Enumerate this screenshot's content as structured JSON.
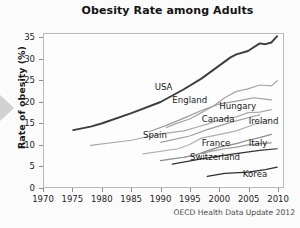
{
  "figure": {
    "title": "Obesity Rate among Adults",
    "source_note": "OECD Health Data Update 2012",
    "nav_arrow_icon": "triangle-right-icon"
  },
  "chart_data": {
    "type": "line",
    "title": "Obesity Rate among Adults",
    "xlabel": "",
    "ylabel": "Rate of obesity (%)",
    "xlim": [
      1970,
      2011
    ],
    "ylim": [
      0,
      36
    ],
    "xticks": [
      1970,
      1975,
      1980,
      1985,
      1990,
      1995,
      2000,
      2005,
      2010
    ],
    "yticks": [
      0,
      5,
      10,
      15,
      20,
      25,
      30,
      35
    ],
    "grid": false,
    "legend_position": "inline-labels",
    "annotation": "OECD Health Data Update 2012",
    "series": [
      {
        "name": "USA",
        "color": "#3d3d3d",
        "label_x": 1989,
        "label_y": 23.5,
        "x": [
          1975,
          1978,
          1980,
          1985,
          1990,
          1994,
          1997,
          1999,
          2000,
          2002,
          2003,
          2005,
          2007,
          2008,
          2009,
          2010
        ],
        "y": [
          13.4,
          14.2,
          15.0,
          17.4,
          20.0,
          23.0,
          25.5,
          27.5,
          28.5,
          30.5,
          31.2,
          32.0,
          33.8,
          33.6,
          34.0,
          35.5
        ]
      },
      {
        "name": "England",
        "color": "#a6a6a6",
        "label_x": 1992,
        "label_y": 20.4,
        "x": [
          1991,
          1993,
          1995,
          1997,
          1999,
          2001,
          2003,
          2005,
          2007,
          2009,
          2010
        ],
        "y": [
          14.0,
          15.1,
          16.0,
          17.5,
          19.0,
          21.0,
          22.5,
          23.1,
          24.0,
          23.8,
          25.0
        ]
      },
      {
        "name": "Hungary",
        "color": "#9d9d9d",
        "label_x": 2000,
        "label_y": 19.0,
        "x": [
          1988,
          1991,
          1994,
          1997,
          2000,
          2003,
          2006,
          2009
        ],
        "y": [
          13.0,
          14.5,
          16.2,
          18.0,
          19.5,
          20.2,
          21.0,
          20.5
        ]
      },
      {
        "name": "Canada",
        "color": "#aaaaaa",
        "label_x": 1997,
        "label_y": 16.0,
        "x": [
          1978,
          1985,
          1990,
          1994,
          1996,
          1998,
          2000,
          2003,
          2005,
          2007,
          2009
        ],
        "y": [
          9.8,
          11.0,
          12.5,
          13.2,
          14.0,
          14.8,
          15.8,
          16.5,
          17.5,
          17.6,
          18.2
        ]
      },
      {
        "name": "Ireland",
        "color": "#9f9f9f",
        "label_x": 2005,
        "label_y": 15.6,
        "x": [
          1990,
          1995,
          1998,
          2002,
          2007
        ],
        "y": [
          10.5,
          12.0,
          13.5,
          15.2,
          17.0
        ]
      },
      {
        "name": "Spain",
        "color": "#b0b0b0",
        "label_x": 1987,
        "label_y": 12.2,
        "x": [
          1987,
          1993,
          1995,
          1997,
          2001,
          2003,
          2006,
          2009
        ],
        "y": [
          7.8,
          9.0,
          10.0,
          11.5,
          12.6,
          13.2,
          14.7,
          16.0
        ]
      },
      {
        "name": "France",
        "color": "#8a8a8a",
        "label_x": 1997,
        "label_y": 10.5,
        "x": [
          1990,
          1992,
          1994,
          1996,
          1998,
          2000,
          2003,
          2005,
          2007,
          2009
        ],
        "y": [
          6.2,
          6.6,
          7.0,
          7.5,
          8.5,
          9.4,
          10.2,
          11.0,
          11.6,
          12.4
        ]
      },
      {
        "name": "Italy",
        "color": "#9a9a9a",
        "label_x": 2005,
        "label_y": 10.4,
        "x": [
          1994,
          1999,
          2001,
          2003,
          2005,
          2007,
          2009
        ],
        "y": [
          7.0,
          8.5,
          9.0,
          9.4,
          9.9,
          10.2,
          10.4
        ]
      },
      {
        "name": "Switzerland",
        "color": "#333333",
        "label_x": 1995,
        "label_y": 7.2,
        "x": [
          1992,
          1997,
          2002,
          2007,
          2010
        ],
        "y": [
          5.4,
          6.6,
          7.7,
          8.6,
          9.0
        ]
      },
      {
        "name": "Korea",
        "color": "#2e2e2e",
        "label_x": 2004,
        "label_y": 3.2,
        "x": [
          1998,
          2001,
          2005,
          2008,
          2010
        ],
        "y": [
          2.5,
          3.2,
          3.5,
          4.1,
          4.7
        ]
      }
    ]
  }
}
